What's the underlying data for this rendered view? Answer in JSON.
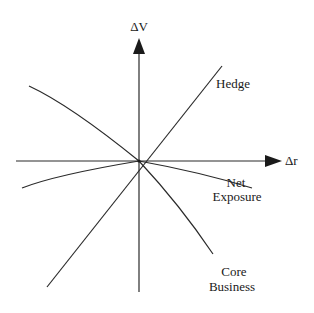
{
  "diagram": {
    "type": "sensitivity-diagram",
    "axes": {
      "y_label": "ΔV",
      "x_label": "Δr"
    },
    "curves": [
      {
        "id": "hedge",
        "label": "Hedge"
      },
      {
        "id": "net-exposure",
        "label_line1": "Net",
        "label_line2": "Exposure"
      },
      {
        "id": "core-business",
        "label_line1": "Core",
        "label_line2": "Business"
      }
    ],
    "colors": {
      "line": "#2a2a2a",
      "text": "#1a1a1a",
      "background": "#ffffff"
    }
  }
}
